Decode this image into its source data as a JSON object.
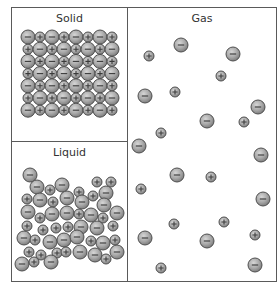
{
  "diagram": {
    "panels": [
      {
        "id": "solid",
        "title": "Solid"
      },
      {
        "id": "liquid",
        "title": "Liquid"
      },
      {
        "id": "gas",
        "title": "Gas"
      }
    ],
    "particle_types": {
      "anion": {
        "sign": "−",
        "radius": 7,
        "fill": "#a9a9a9",
        "stroke": "#4f4f4f"
      },
      "cation": {
        "sign": "+",
        "radius": 5,
        "fill": "#a9a9a9",
        "stroke": "#4f4f4f"
      }
    },
    "solid": {
      "rows": 7,
      "cols": 8,
      "origin_x": 28,
      "origin_y": 37,
      "spacing_x": 12,
      "spacing_y": 12.2,
      "pattern": "alternating, row 0 starts with anion"
    },
    "liquid": {
      "particles": [
        {
          "t": "a",
          "x": 30,
          "y": 175
        },
        {
          "t": "a",
          "x": 37,
          "y": 187
        },
        {
          "t": "c",
          "x": 50,
          "y": 190
        },
        {
          "t": "a",
          "x": 62,
          "y": 185
        },
        {
          "t": "c",
          "x": 79,
          "y": 192
        },
        {
          "t": "c",
          "x": 97,
          "y": 182
        },
        {
          "t": "c",
          "x": 111,
          "y": 182
        },
        {
          "t": "a",
          "x": 106,
          "y": 193
        },
        {
          "t": "c",
          "x": 27,
          "y": 199
        },
        {
          "t": "a",
          "x": 40,
          "y": 200
        },
        {
          "t": "c",
          "x": 53,
          "y": 202
        },
        {
          "t": "a",
          "x": 67,
          "y": 198
        },
        {
          "t": "a",
          "x": 82,
          "y": 202
        },
        {
          "t": "c",
          "x": 93,
          "y": 196
        },
        {
          "t": "a",
          "x": 104,
          "y": 205
        },
        {
          "t": "a",
          "x": 28,
          "y": 212
        },
        {
          "t": "c",
          "x": 40,
          "y": 218
        },
        {
          "t": "a",
          "x": 52,
          "y": 214
        },
        {
          "t": "a",
          "x": 67,
          "y": 213
        },
        {
          "t": "c",
          "x": 79,
          "y": 214
        },
        {
          "t": "a",
          "x": 91,
          "y": 215
        },
        {
          "t": "c",
          "x": 103,
          "y": 218
        },
        {
          "t": "a",
          "x": 117,
          "y": 213
        },
        {
          "t": "c",
          "x": 27,
          "y": 226
        },
        {
          "t": "c",
          "x": 43,
          "y": 230
        },
        {
          "t": "c",
          "x": 56,
          "y": 228
        },
        {
          "t": "c",
          "x": 68,
          "y": 227
        },
        {
          "t": "a",
          "x": 81,
          "y": 227
        },
        {
          "t": "a",
          "x": 97,
          "y": 228
        },
        {
          "t": "c",
          "x": 113,
          "y": 226
        },
        {
          "t": "a",
          "x": 24,
          "y": 238
        },
        {
          "t": "c",
          "x": 35,
          "y": 240
        },
        {
          "t": "a",
          "x": 50,
          "y": 242
        },
        {
          "t": "a",
          "x": 64,
          "y": 240
        },
        {
          "t": "a",
          "x": 77,
          "y": 237
        },
        {
          "t": "c",
          "x": 91,
          "y": 241
        },
        {
          "t": "a",
          "x": 103,
          "y": 243
        },
        {
          "t": "c",
          "x": 115,
          "y": 240
        },
        {
          "t": "c",
          "x": 29,
          "y": 252
        },
        {
          "t": "c",
          "x": 41,
          "y": 255
        },
        {
          "t": "c",
          "x": 57,
          "y": 253
        },
        {
          "t": "c",
          "x": 66,
          "y": 252
        },
        {
          "t": "a",
          "x": 80,
          "y": 252
        },
        {
          "t": "a",
          "x": 95,
          "y": 255
        },
        {
          "t": "c",
          "x": 106,
          "y": 259
        },
        {
          "t": "a",
          "x": 117,
          "y": 252
        },
        {
          "t": "a",
          "x": 22,
          "y": 264
        },
        {
          "t": "c",
          "x": 34,
          "y": 262
        },
        {
          "t": "a",
          "x": 51,
          "y": 262
        }
      ]
    },
    "gas": {
      "particles": [
        {
          "t": "a",
          "x": 181,
          "y": 45
        },
        {
          "t": "c",
          "x": 149,
          "y": 56
        },
        {
          "t": "a",
          "x": 233,
          "y": 54
        },
        {
          "t": "c",
          "x": 221,
          "y": 76
        },
        {
          "t": "a",
          "x": 145,
          "y": 96
        },
        {
          "t": "c",
          "x": 175,
          "y": 92
        },
        {
          "t": "a",
          "x": 258,
          "y": 107
        },
        {
          "t": "a",
          "x": 207,
          "y": 121
        },
        {
          "t": "c",
          "x": 244,
          "y": 122
        },
        {
          "t": "c",
          "x": 161,
          "y": 133
        },
        {
          "t": "a",
          "x": 139,
          "y": 146
        },
        {
          "t": "a",
          "x": 261,
          "y": 155
        },
        {
          "t": "a",
          "x": 177,
          "y": 175
        },
        {
          "t": "c",
          "x": 211,
          "y": 177
        },
        {
          "t": "c",
          "x": 141,
          "y": 189
        },
        {
          "t": "a",
          "x": 263,
          "y": 199
        },
        {
          "t": "c",
          "x": 174,
          "y": 224
        },
        {
          "t": "c",
          "x": 224,
          "y": 222
        },
        {
          "t": "a",
          "x": 145,
          "y": 238
        },
        {
          "t": "a",
          "x": 207,
          "y": 241
        },
        {
          "t": "c",
          "x": 255,
          "y": 235
        },
        {
          "t": "c",
          "x": 161,
          "y": 268
        },
        {
          "t": "a",
          "x": 255,
          "y": 265
        }
      ]
    }
  }
}
